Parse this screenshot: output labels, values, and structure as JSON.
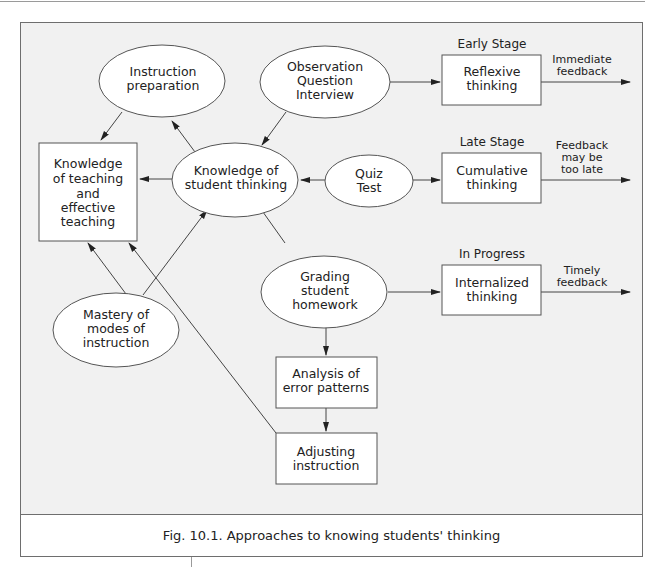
{
  "figure": {
    "caption": "Fig. 10.1. Approaches to knowing students' thinking",
    "colors": {
      "panel_bg": "#f1f1f1",
      "node_fill": "#ffffff",
      "stroke": "#555555"
    }
  },
  "nodes": {
    "knowledge_teaching": {
      "shape": "rect",
      "lines": [
        "Knowledge",
        "of teaching",
        "and",
        "effective",
        "teaching"
      ]
    },
    "instruction_prep": {
      "shape": "ellipse",
      "lines": [
        "Instruction",
        "preparation"
      ]
    },
    "observation": {
      "shape": "ellipse",
      "lines": [
        "Observation",
        "Question",
        "Interview"
      ]
    },
    "knowledge_student": {
      "shape": "ellipse",
      "lines": [
        "Knowledge of",
        "student thinking"
      ]
    },
    "quiz": {
      "shape": "ellipse",
      "lines": [
        "Quiz",
        "Test"
      ]
    },
    "grading": {
      "shape": "ellipse",
      "lines": [
        "Grading",
        "student",
        "homework"
      ]
    },
    "mastery": {
      "shape": "ellipse",
      "lines": [
        "Mastery of",
        "modes of",
        "instruction"
      ]
    },
    "analysis": {
      "shape": "rect",
      "lines": [
        "Analysis of",
        "error patterns"
      ]
    },
    "adjusting": {
      "shape": "rect",
      "lines": [
        "Adjusting",
        "instruction"
      ]
    },
    "reflexive": {
      "shape": "rect",
      "lines": [
        "Reflexive",
        "thinking"
      ]
    },
    "cumulative": {
      "shape": "rect",
      "lines": [
        "Cumulative",
        "thinking"
      ]
    },
    "internalized": {
      "shape": "rect",
      "lines": [
        "Internalized",
        "thinking"
      ]
    }
  },
  "stages": {
    "early": "Early Stage",
    "late": "Late Stage",
    "progress": "In Progress"
  },
  "feedback": {
    "immediate": [
      "Immediate",
      "feedback"
    ],
    "late": [
      "Feedback",
      "may be",
      "too late"
    ],
    "timely": [
      "Timely",
      "feedback"
    ]
  },
  "edges": [
    {
      "from": "instruction_prep",
      "to": "knowledge_teaching"
    },
    {
      "from": "knowledge_student",
      "to": "instruction_prep"
    },
    {
      "from": "observation",
      "to": "knowledge_student"
    },
    {
      "from": "observation",
      "to": "reflexive"
    },
    {
      "from": "knowledge_student",
      "to": "knowledge_teaching"
    },
    {
      "from": "quiz",
      "to": "knowledge_student"
    },
    {
      "from": "quiz",
      "to": "cumulative"
    },
    {
      "from": "grading",
      "to": "knowledge_student"
    },
    {
      "from": "grading",
      "to": "internalized"
    },
    {
      "from": "grading",
      "to": "analysis"
    },
    {
      "from": "analysis",
      "to": "adjusting"
    },
    {
      "from": "mastery",
      "to": "knowledge_teaching"
    },
    {
      "from": "mastery",
      "to": "knowledge_student"
    },
    {
      "from": "adjusting",
      "to": "knowledge_teaching"
    },
    {
      "from": "reflexive",
      "to": "immediate_feedback"
    },
    {
      "from": "cumulative",
      "to": "late_feedback"
    },
    {
      "from": "internalized",
      "to": "timely_feedback"
    }
  ]
}
